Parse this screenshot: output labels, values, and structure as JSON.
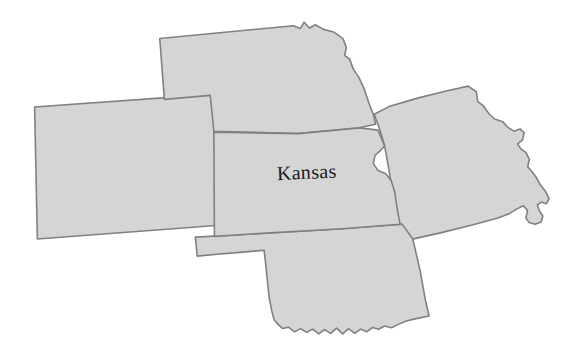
{
  "map": {
    "title": "Kansas and surrounding states",
    "focus_state": "Kansas",
    "background_color": "#ffffff",
    "fill_color": "#d5d5d5",
    "stroke_color": "#808080",
    "stroke_width": 1.6,
    "label_color": "#1a1a1a",
    "rotation_degrees": -2.5,
    "labels": [
      {
        "name": "kansas",
        "text": "Kansas",
        "x": 307,
        "y": 175,
        "font_size": 20
      }
    ],
    "states": [
      {
        "name": "colorado",
        "label": "Colorado",
        "position": "west",
        "labeled_on_map": false,
        "path": "M 38,96 L 219,91 L 224,222 L 35,228 Z"
      },
      {
        "name": "nebraska",
        "label": "Nebraska",
        "position": "north",
        "labeled_on_map": false,
        "path": "M 166,33 L 300,26 L 307,29 L 311,23 L 316,29 L 322,26 L 330,31 L 340,34 L 349,41 L 352,50 L 350,58 L 355,62 L 358,72 L 363,80 L 368,92 L 372,106 L 376,118 L 378,128 L 360,131 L 300,134 L 216,128 L 214,92 L 168,94 Z"
      },
      {
        "name": "missouri",
        "label": "Missouri",
        "position": "east",
        "labeled_on_map": false,
        "path": "M 377,118 L 392,111 L 420,104 L 450,98 L 472,94 L 480,100 L 481,110 L 486,114 L 492,123 L 497,128 L 505,131 L 510,137 L 516,141 L 522,139 L 526,143 L 524,150 L 519,154 L 522,159 L 527,163 L 530,170 L 528,177 L 532,182 L 536,188 L 540,196 L 545,203 L 548,210 L 545,215 L 540,213 L 536,216 L 538,222 L 541,227 L 539,233 L 533,235 L 527,233 L 524,228 L 526,221 L 522,216 L 515,219 L 508,223 L 496,227 L 470,233 L 440,239 L 412,244 L 398,246 L 394,219 L 392,196 L 389,172 L 386,150 L 382,134 Z"
      },
      {
        "name": "oklahoma",
        "label": "Oklahoma",
        "position": "south",
        "labeled_on_map": false,
        "path": "M 193,233 L 268,232 L 340,231 L 400,229 L 410,244 L 416,276 L 420,306 L 423,322 L 410,324 L 400,326 L 392,329 L 385,332 L 378,330 L 372,333 L 366,331 L 360,335 L 354,332 L 348,336 L 342,331 L 336,336 L 330,330 L 324,335 L 318,331 L 312,335 L 306,330 L 300,333 L 294,329 L 288,332 L 282,327 L 276,328 L 272,324 L 268,319 L 266,310 L 264,296 L 263,280 L 262,262 L 261,249 L 240,250 L 214,251 L 194,252 Z"
      },
      {
        "name": "kansas",
        "label": "Kansas",
        "position": "center",
        "labeled_on_map": true,
        "path": "M 216,129 L 300,134 L 362,131 L 380,134 L 386,150 L 381,155 L 376,159 L 374,167 L 378,174 L 386,178 L 391,185 L 394,196 L 396,215 L 398,229 L 340,231 L 268,232 L 212,233 Z"
      }
    ]
  }
}
